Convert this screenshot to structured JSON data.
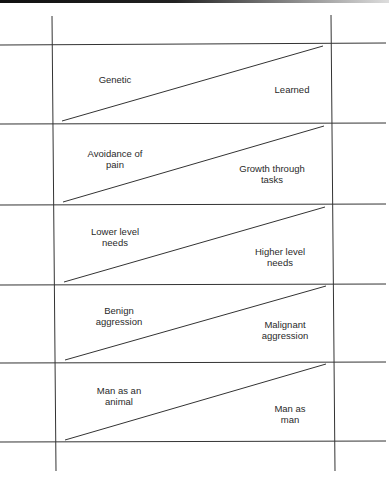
{
  "diagram": {
    "type": "continuum-table",
    "rows": [
      {
        "left": [
          "Genetic"
        ],
        "right": [
          "Learned"
        ]
      },
      {
        "left": [
          "Avoidance of",
          "pain"
        ],
        "right": [
          "Growth through",
          "tasks"
        ]
      },
      {
        "left": [
          "Lower level",
          "needs"
        ],
        "right": [
          "Higher level",
          "needs"
        ]
      },
      {
        "left": [
          "Benign",
          "aggression"
        ],
        "right": [
          "Malignant",
          "aggression"
        ]
      },
      {
        "left": [
          "Man as an",
          "animal"
        ],
        "right": [
          "Man as",
          "man"
        ]
      }
    ]
  }
}
